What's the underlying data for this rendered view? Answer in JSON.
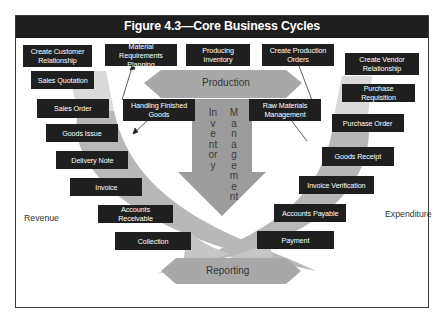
{
  "figure": {
    "title": "Figure 4.3—Core Business Cycles"
  },
  "center": {
    "production": "Production",
    "inventory_management_left": "Inventory",
    "inventory_management_right": "Management",
    "reporting": "Reporting"
  },
  "side_labels": {
    "revenue": "Revenue",
    "expenditure": "Expenditure"
  },
  "top_boxes": [
    {
      "label": "Create Customer Relationship"
    },
    {
      "label": "Material Requirements Planning"
    },
    {
      "label": "Producing Inventory"
    },
    {
      "label": "Create Production Orders"
    }
  ],
  "mid_boxes": [
    {
      "label": "Handling Finished Goods"
    },
    {
      "label": "Raw Materials Management"
    }
  ],
  "revenue_cycle": [
    {
      "label": "Sales Quotation"
    },
    {
      "label": "Sales Order"
    },
    {
      "label": "Goods Issue"
    },
    {
      "label": "Delivery Note"
    },
    {
      "label": "Invoice"
    },
    {
      "label": "Accounts Receivable"
    },
    {
      "label": "Collection"
    }
  ],
  "expenditure_cycle": [
    {
      "label": "Create Vendor Relationship"
    },
    {
      "label": "Purchase Requisition"
    },
    {
      "label": "Purchase Order"
    },
    {
      "label": "Goods Receipt"
    },
    {
      "label": "Invoice Verification"
    },
    {
      "label": "Accounts Payable"
    },
    {
      "label": "Payment"
    }
  ],
  "colors": {
    "box_fill": "#1f1f1f",
    "arrow_fill": "#a6a6a6",
    "arc_fill": "#b5b5b5",
    "title_bar": "#1e1e1e"
  }
}
